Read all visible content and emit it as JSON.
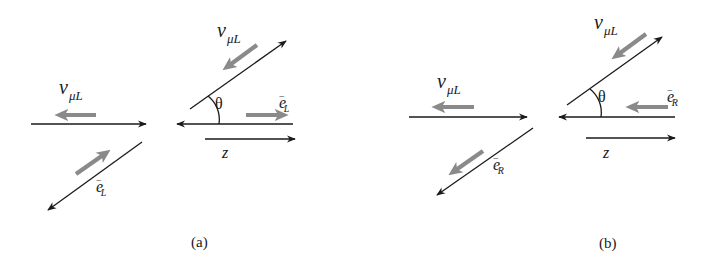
{
  "figure": {
    "panels": [
      {
        "caption": "(a)",
        "incoming_neutrino_label": "ν",
        "incoming_neutrino_sub": "μL",
        "incoming_electron_label": "e",
        "incoming_electron_sup": "−",
        "incoming_electron_sub": "L",
        "outgoing_neutrino_label": "ν",
        "outgoing_neutrino_sub": "μL",
        "outgoing_electron_label": "e",
        "outgoing_electron_sup": "−",
        "outgoing_electron_sub": "L",
        "angle_label": "θ",
        "axis_label": "z"
      },
      {
        "caption": "(b)",
        "incoming_neutrino_label": "ν",
        "incoming_neutrino_sub": "μL",
        "incoming_electron_label": "e",
        "incoming_electron_sup": "−",
        "incoming_electron_sub": "R",
        "outgoing_neutrino_label": "ν",
        "outgoing_neutrino_sub": "μL",
        "outgoing_electron_label": "e",
        "outgoing_electron_sup": "−",
        "outgoing_electron_sub": "R",
        "angle_label": "θ",
        "axis_label": "z"
      }
    ],
    "colors": {
      "momentum_line": "#1a1a1a",
      "spin_arrow": "#8a8a8a",
      "background": "#ffffff"
    }
  }
}
